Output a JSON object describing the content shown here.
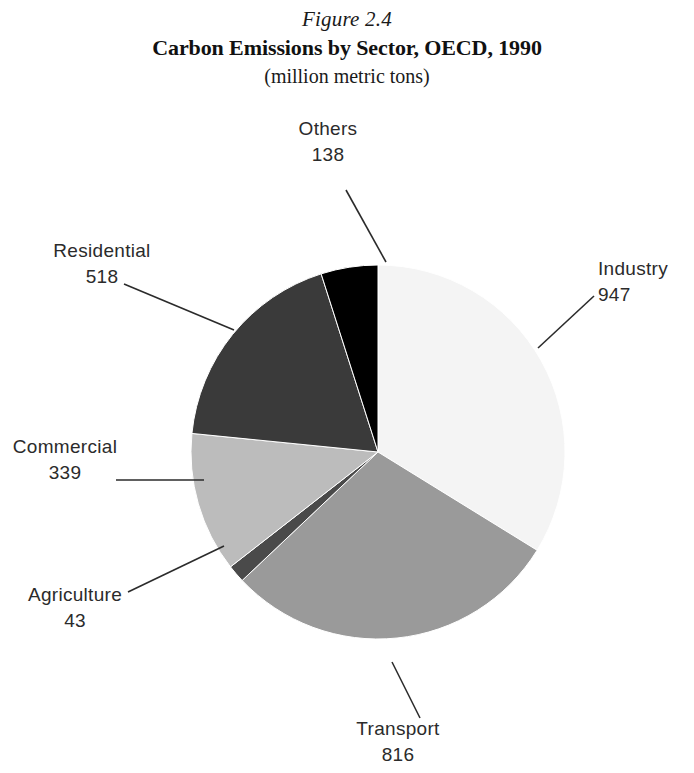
{
  "figure": {
    "number": "Figure 2.4",
    "title": "Carbon Emissions by Sector, OECD, 1990",
    "subtitle": "(million metric tons)"
  },
  "chart_data": {
    "type": "pie",
    "title": "Carbon Emissions by Sector, OECD, 1990",
    "subtitle": "(million metric tons)",
    "figure_number": "Figure 2.4",
    "unit": "million metric tons",
    "total": 2801,
    "legend": "none (direct labels with leader lines)",
    "start_angle_deg": 0,
    "direction": "clockwise",
    "categories": [
      "Industry",
      "Transport",
      "Agriculture",
      "Commercial",
      "Residential",
      "Others"
    ],
    "values": [
      947,
      816,
      43,
      339,
      518,
      138
    ],
    "colors": [
      "#f4f4f4",
      "#9a9a9a",
      "#4a4a4a",
      "#bcbcbc",
      "#3a3a3a",
      "#000000"
    ],
    "slices": [
      {
        "label": "Industry",
        "value": "947",
        "value_num": 947,
        "color": "#f4f4f4",
        "percent": 33.8,
        "start_deg": 0.0,
        "end_deg": 121.7
      },
      {
        "label": "Transport",
        "value": "816",
        "value_num": 816,
        "color": "#9a9a9a",
        "percent": 29.1,
        "start_deg": 121.7,
        "end_deg": 226.6
      },
      {
        "label": "Agriculture",
        "value": "43",
        "value_num": 43,
        "color": "#4a4a4a",
        "percent": 1.5,
        "start_deg": 226.6,
        "end_deg": 232.1
      },
      {
        "label": "Commercial",
        "value": "339",
        "value_num": 339,
        "color": "#bcbcbc",
        "percent": 12.1,
        "start_deg": 232.1,
        "end_deg": 275.7
      },
      {
        "label": "Residential",
        "value": "518",
        "value_num": 518,
        "color": "#3a3a3a",
        "percent": 18.5,
        "start_deg": 275.7,
        "end_deg": 342.3
      },
      {
        "label": "Others",
        "value": "138",
        "value_num": 138,
        "color": "#000000",
        "percent": 4.9,
        "start_deg": 342.3,
        "end_deg": 360.0
      }
    ]
  },
  "labels": {
    "others": {
      "name": "Others",
      "value": "138"
    },
    "industry": {
      "name": "Industry",
      "value": "947"
    },
    "residential": {
      "name": "Residential",
      "value": "518"
    },
    "commercial": {
      "name": "Commercial",
      "value": "339"
    },
    "agriculture": {
      "name": "Agriculture",
      "value": "43"
    },
    "transport": {
      "name": "Transport",
      "value": "816"
    }
  }
}
